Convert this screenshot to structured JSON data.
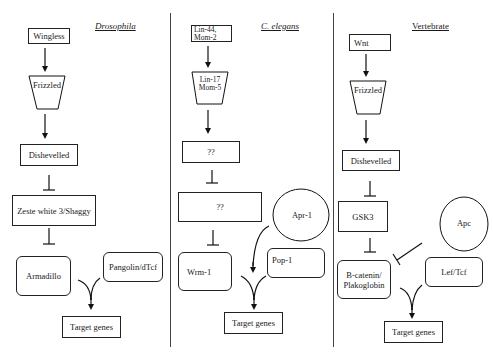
{
  "columns": [
    {
      "title": "Drosophila",
      "title_italic": true,
      "ligand": "Wingless",
      "receptor": "Frizzled",
      "step3": "Dishevelled",
      "step4": "Zeste white 3/Shaggy",
      "effector": "Armadillo",
      "cofactor": "Pangolin/dTcf",
      "output": "Target genes"
    },
    {
      "title": "C. elegans",
      "title_italic": true,
      "ligand_line1": "Lin-44,",
      "ligand_line2": "Mom-2",
      "receptor_line1": "Lin-17",
      "receptor_line2": "Mom-5",
      "step3": "??",
      "step4": "??",
      "regulator": "Apr-1",
      "effector": "Wrm-1",
      "cofactor": "Pop-1",
      "output": "Target genes"
    },
    {
      "title": "Vertebrate",
      "title_italic": false,
      "ligand": "Wnt",
      "receptor": "Frizzled",
      "step3": "Dishevelled",
      "step4": "GSK3",
      "regulator": "Apc",
      "effector_line1": "B-catenin/",
      "effector_line2": "Plakoglobin",
      "cofactor": "Lef/Tcf",
      "output": "Target genes"
    }
  ]
}
